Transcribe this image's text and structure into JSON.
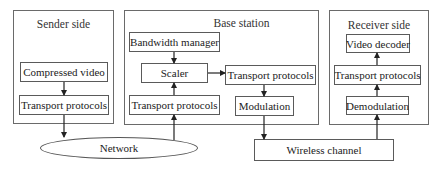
{
  "diagram": {
    "panels": {
      "sender": {
        "title": "Sender side"
      },
      "base": {
        "title": "Base station"
      },
      "receiver": {
        "title": "Receiver side"
      }
    },
    "nodes": {
      "compressed_video": "Compressed video",
      "sender_transport": "Transport protocols",
      "bandwidth_manager": "Bandwidth manager",
      "scaler": "Scaler",
      "base_transport_in": "Transport protocols",
      "base_transport_out": "Transport protocols",
      "modulation": "Modulation",
      "video_decoder": "Video decoder",
      "receiver_transport": "Transport protocols",
      "demodulation": "Demodulation",
      "network": "Network",
      "wireless_channel": "Wireless channel"
    },
    "edges": [
      [
        "compressed_video",
        "sender_transport"
      ],
      [
        "sender_transport",
        "network"
      ],
      [
        "network",
        "base_transport_in"
      ],
      [
        "base_transport_in",
        "scaler"
      ],
      [
        "bandwidth_manager",
        "scaler"
      ],
      [
        "scaler",
        "base_transport_out"
      ],
      [
        "base_transport_out",
        "modulation"
      ],
      [
        "modulation",
        "wireless_channel"
      ],
      [
        "wireless_channel",
        "demodulation"
      ],
      [
        "demodulation",
        "receiver_transport"
      ],
      [
        "receiver_transport",
        "video_decoder"
      ]
    ]
  }
}
